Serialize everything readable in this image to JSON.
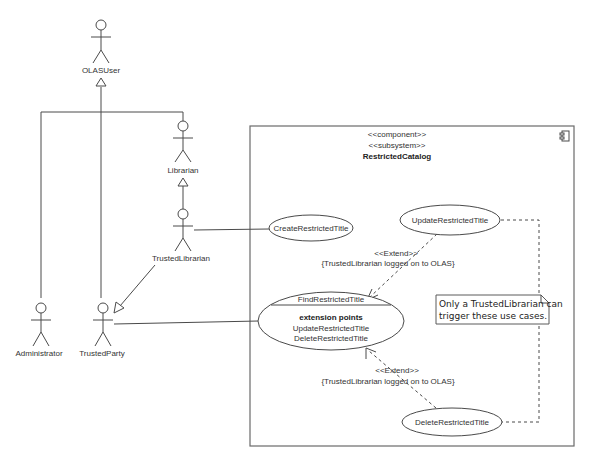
{
  "diagram": {
    "type": "uml-use-case",
    "actors": [
      {
        "id": "olasuser",
        "label": "OLASUser"
      },
      {
        "id": "librarian",
        "label": "Librarian"
      },
      {
        "id": "trusted_librarian",
        "label": "TrustedLibrarian"
      },
      {
        "id": "administrator",
        "label": "Administrator"
      },
      {
        "id": "trusted_party",
        "label": "TrustedParty"
      }
    ],
    "subsystem": {
      "stereotype1": "<<component>>",
      "stereotype2": "<<subsystem>>",
      "name": "RestrictedCatalog",
      "icon": "component-icon"
    },
    "use_cases": {
      "create": "CreateRestrictedTitle",
      "update": "UpdateRestrictedTitle",
      "find": "FindRestrictedTitle",
      "find_ext_header": "extension points",
      "find_ext_1": "UpdateRestrictedTitle",
      "find_ext_2": "DeleteRestrictedTitle",
      "delete": "DeleteRestrictedTitle"
    },
    "extends": [
      {
        "stereotype": "<<Extend>>",
        "condition": "{TrustedLibrarian logged on to OLAS}"
      },
      {
        "stereotype": "<<Extend>>",
        "condition": "{TrustedLibrarian logged on to OLAS}"
      }
    ],
    "note": {
      "line1": "Only a TrustedLibrarian can",
      "line2": "trigger these use cases."
    },
    "relations": [
      {
        "type": "generalization",
        "from": "Librarian",
        "to": "OLASUser"
      },
      {
        "type": "generalization",
        "from": "Administrator",
        "to": "OLASUser"
      },
      {
        "type": "generalization",
        "from": "TrustedParty",
        "to": "OLASUser"
      },
      {
        "type": "generalization",
        "from": "TrustedLibrarian",
        "to": "Librarian"
      },
      {
        "type": "generalization",
        "from": "TrustedLibrarian",
        "to": "TrustedParty"
      },
      {
        "type": "association",
        "from": "TrustedLibrarian",
        "to": "CreateRestrictedTitle"
      },
      {
        "type": "association",
        "from": "TrustedParty",
        "to": "FindRestrictedTitle"
      },
      {
        "type": "extend",
        "from": "UpdateRestrictedTitle",
        "to": "FindRestrictedTitle"
      },
      {
        "type": "extend",
        "from": "DeleteRestrictedTitle",
        "to": "FindRestrictedTitle"
      },
      {
        "type": "note-anchor",
        "from": "note",
        "to": "UpdateRestrictedTitle"
      },
      {
        "type": "note-anchor",
        "from": "note",
        "to": "DeleteRestrictedTitle"
      }
    ]
  }
}
